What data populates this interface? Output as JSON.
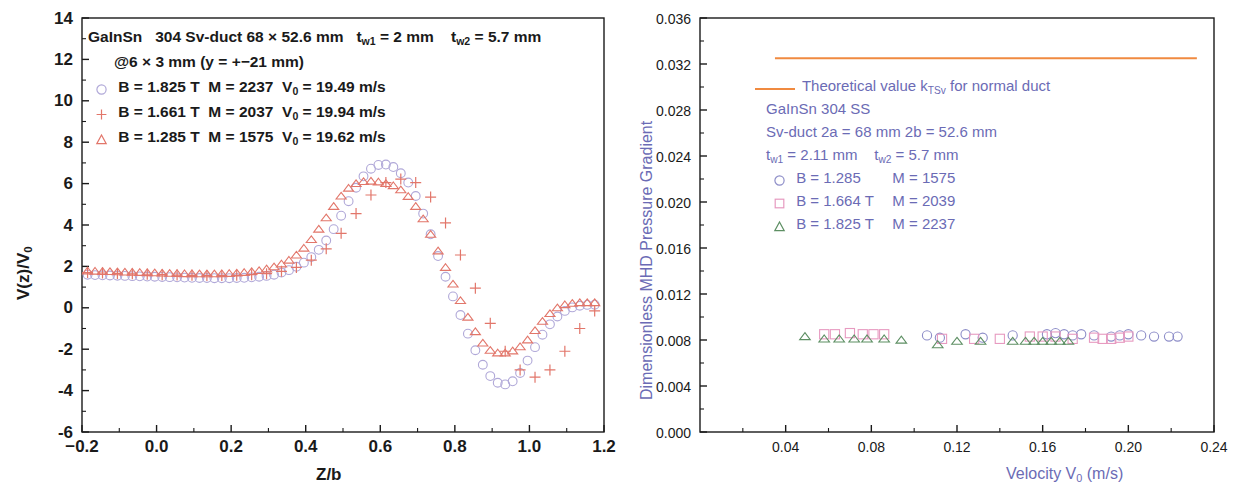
{
  "chart_data": [
    {
      "panel": "left",
      "type": "scatter",
      "title": "",
      "xlabel": "Z/b",
      "ylabel": "V(z)/V0",
      "ylabel_display": "V(z)/V₀",
      "xlim": [
        -0.2,
        1.2
      ],
      "ylim": [
        -6,
        14
      ],
      "xticks": [
        "−0.2",
        "0.0",
        "0.2",
        "0.4",
        "0.6",
        "0.8",
        "1.0",
        "1.2"
      ],
      "xtick_values": [
        -0.2,
        0.0,
        0.2,
        0.4,
        0.6,
        0.8,
        1.0,
        1.2
      ],
      "yticks": [
        "14",
        "12",
        "10",
        "8",
        "6",
        "4",
        "2",
        "0",
        "-2",
        "-4",
        "-6"
      ],
      "ytick_values": [
        14,
        12,
        10,
        8,
        6,
        4,
        2,
        0,
        -2,
        -4,
        -6
      ],
      "grid": false,
      "minor_ticks": true,
      "annotation_lines": [
        "GaInSn   304 Sv-duct 68 × 52.6 mm   t_w1 = 2 mm    t_w2 = 5.7 mm",
        "@6 × 3 mm   (y = +−21 mm)"
      ],
      "legend_position": "upper-left-inside",
      "series": [
        {
          "name": "B = 1.825 T M = 2237  V0 = 19.49 m/s",
          "marker": "circle",
          "color": "#b0a8d8",
          "x": [
            -0.185,
            -0.165,
            -0.145,
            -0.125,
            -0.105,
            -0.085,
            -0.065,
            -0.045,
            -0.025,
            -0.005,
            0.015,
            0.035,
            0.055,
            0.075,
            0.095,
            0.115,
            0.135,
            0.155,
            0.175,
            0.195,
            0.215,
            0.235,
            0.255,
            0.275,
            0.295,
            0.315,
            0.335,
            0.355,
            0.375,
            0.395,
            0.415,
            0.435,
            0.455,
            0.475,
            0.495,
            0.515,
            0.535,
            0.555,
            0.575,
            0.595,
            0.615,
            0.635,
            0.655,
            0.675,
            0.695,
            0.715,
            0.735,
            0.755,
            0.775,
            0.795,
            0.815,
            0.835,
            0.855,
            0.875,
            0.895,
            0.915,
            0.935,
            0.955,
            0.975,
            0.995,
            1.015,
            1.035,
            1.055,
            1.075,
            1.095,
            1.115,
            1.135,
            1.155,
            1.175
          ],
          "y": [
            1.6,
            1.58,
            1.57,
            1.56,
            1.55,
            1.54,
            1.53,
            1.52,
            1.51,
            1.5,
            1.49,
            1.48,
            1.47,
            1.46,
            1.45,
            1.44,
            1.44,
            1.43,
            1.43,
            1.43,
            1.44,
            1.45,
            1.47,
            1.5,
            1.54,
            1.6,
            1.7,
            1.82,
            1.98,
            2.18,
            2.45,
            2.8,
            3.25,
            3.8,
            4.45,
            5.15,
            5.8,
            6.35,
            6.72,
            6.9,
            6.92,
            6.8,
            6.5,
            6.05,
            5.4,
            4.55,
            3.55,
            2.5,
            1.5,
            0.55,
            -0.35,
            -1.25,
            -2.05,
            -2.75,
            -3.3,
            -3.62,
            -3.7,
            -3.55,
            -3.15,
            -2.55,
            -1.9,
            -1.3,
            -0.8,
            -0.42,
            -0.15,
            0.02,
            0.1,
            0.14,
            0.15
          ]
        },
        {
          "name": "B = 1.661 T M = 2037  V0 = 19.94 m/s",
          "marker": "plus",
          "color": "#e2766a",
          "x": [
            -0.185,
            -0.145,
            -0.105,
            -0.065,
            -0.025,
            0.015,
            0.055,
            0.095,
            0.135,
            0.175,
            0.215,
            0.255,
            0.295,
            0.335,
            0.375,
            0.415,
            0.455,
            0.495,
            0.535,
            0.575,
            0.615,
            0.655,
            0.695,
            0.735,
            0.775,
            0.815,
            0.855,
            0.895,
            0.935,
            0.975,
            1.015,
            1.055,
            1.095,
            1.135,
            1.175
          ],
          "y": [
            1.7,
            1.68,
            1.66,
            1.64,
            1.62,
            1.6,
            1.58,
            1.57,
            1.56,
            1.56,
            1.57,
            1.6,
            1.65,
            1.76,
            1.95,
            2.3,
            2.85,
            3.6,
            4.55,
            5.45,
            6.05,
            6.22,
            6.05,
            5.35,
            4.1,
            2.55,
            0.95,
            -0.75,
            -2.1,
            -3.0,
            -3.35,
            -3.0,
            -2.1,
            -1.0,
            -0.15
          ]
        },
        {
          "name": "B = 1.285 T M = 1575  V0 = 19.62 m/s",
          "marker": "triangle",
          "color": "#e2766a",
          "x": [
            -0.185,
            -0.165,
            -0.145,
            -0.125,
            -0.105,
            -0.085,
            -0.065,
            -0.045,
            -0.025,
            -0.005,
            0.015,
            0.035,
            0.055,
            0.075,
            0.095,
            0.115,
            0.135,
            0.155,
            0.175,
            0.195,
            0.215,
            0.235,
            0.255,
            0.275,
            0.295,
            0.315,
            0.335,
            0.355,
            0.375,
            0.395,
            0.415,
            0.435,
            0.455,
            0.475,
            0.495,
            0.515,
            0.535,
            0.555,
            0.575,
            0.595,
            0.615,
            0.635,
            0.655,
            0.675,
            0.695,
            0.715,
            0.735,
            0.755,
            0.775,
            0.795,
            0.815,
            0.835,
            0.855,
            0.875,
            0.895,
            0.915,
            0.935,
            0.955,
            0.975,
            0.995,
            1.015,
            1.035,
            1.055,
            1.075,
            1.095,
            1.115,
            1.135,
            1.155,
            1.175
          ],
          "y": [
            1.78,
            1.77,
            1.76,
            1.75,
            1.74,
            1.73,
            1.72,
            1.71,
            1.7,
            1.69,
            1.68,
            1.67,
            1.66,
            1.65,
            1.65,
            1.64,
            1.64,
            1.64,
            1.65,
            1.66,
            1.68,
            1.71,
            1.75,
            1.8,
            1.88,
            1.98,
            2.12,
            2.3,
            2.55,
            2.88,
            3.3,
            3.8,
            4.35,
            4.9,
            5.4,
            5.78,
            6.0,
            6.1,
            6.12,
            6.08,
            6.0,
            5.9,
            5.7,
            5.38,
            4.9,
            4.3,
            3.55,
            2.75,
            1.95,
            1.15,
            0.35,
            -0.45,
            -1.15,
            -1.7,
            -2.05,
            -2.18,
            -2.18,
            -2.08,
            -1.88,
            -1.55,
            -1.1,
            -0.65,
            -0.28,
            0.0,
            0.15,
            0.22,
            0.25,
            0.25,
            0.25
          ]
        }
      ]
    },
    {
      "panel": "right",
      "type": "scatter",
      "title": "",
      "xlabel": "Velocity V0 (m/s)",
      "xlabel_display": "Velocity V₀  (m/s)",
      "ylabel": "Dimensionless MHD Pressure Gradient",
      "xlim": [
        0.0,
        0.24
      ],
      "ylim": [
        0.0,
        0.036
      ],
      "xticks": [
        "0.04",
        "0.08",
        "0.12",
        "0.16",
        "0.20",
        "0.24"
      ],
      "xtick_values": [
        0.04,
        0.08,
        0.12,
        0.16,
        0.2,
        0.24
      ],
      "yticks": [
        "0.036",
        "0.032",
        "0.028",
        "0.024",
        "0.020",
        "0.016",
        "0.012",
        "0.008",
        "0.004",
        "0.000"
      ],
      "ytick_values": [
        0.036,
        0.032,
        0.028,
        0.024,
        0.02,
        0.016,
        0.012,
        0.008,
        0.004,
        0.0
      ],
      "grid": false,
      "minor_ticks": true,
      "legend_position": "upper-middle-inside",
      "annotation_lines": [
        "GaInSn  304 SS",
        "Sv-duct   2a = 68 mm   2b = 52.6 mm",
        "t_w1 = 2.11 mm    t_w2 = 5.7 mm"
      ],
      "reference_line": {
        "name": "Theoretical value k_TSv for normal duct",
        "color": "#f08a40",
        "value": 0.0325,
        "x_start": 0.035,
        "x_end": 0.232
      },
      "series": [
        {
          "name": "B = 1.285    M = 1575",
          "marker": "circle",
          "color": "#8d8dc8",
          "x": [
            0.106,
            0.112,
            0.124,
            0.132,
            0.146,
            0.162,
            0.166,
            0.17,
            0.174,
            0.178,
            0.184,
            0.192,
            0.196,
            0.2,
            0.206,
            0.212,
            0.219,
            0.223
          ],
          "y": [
            0.0084,
            0.0082,
            0.0085,
            0.0082,
            0.0084,
            0.0085,
            0.0086,
            0.0085,
            0.0084,
            0.0085,
            0.0084,
            0.0083,
            0.0084,
            0.0085,
            0.0084,
            0.0083,
            0.0083,
            0.0083
          ]
        },
        {
          "name": "B = 1.664 T  M = 2039",
          "marker": "square",
          "color": "#e79ac0",
          "x": [
            0.058,
            0.063,
            0.07,
            0.076,
            0.081,
            0.086,
            0.113,
            0.128,
            0.14,
            0.154,
            0.16,
            0.166,
            0.174,
            0.184,
            0.188,
            0.192,
            0.196,
            0.2
          ],
          "y": [
            0.0085,
            0.0085,
            0.0086,
            0.0085,
            0.0085,
            0.0085,
            0.0081,
            0.0081,
            0.0081,
            0.0083,
            0.0083,
            0.0083,
            0.0081,
            0.0082,
            0.0081,
            0.0081,
            0.0082,
            0.0083
          ]
        },
        {
          "name": "B = 1.825 T  M = 2237",
          "marker": "triangle",
          "color": "#5d8f63",
          "x": [
            0.049,
            0.058,
            0.065,
            0.072,
            0.078,
            0.086,
            0.094,
            0.111,
            0.12,
            0.131,
            0.146,
            0.152,
            0.156,
            0.16,
            0.164,
            0.168,
            0.172
          ],
          "y": [
            0.0083,
            0.0081,
            0.0081,
            0.0081,
            0.0081,
            0.0081,
            0.008,
            0.0076,
            0.0079,
            0.0079,
            0.0079,
            0.0079,
            0.0079,
            0.0079,
            0.0079,
            0.0079,
            0.0079
          ]
        }
      ]
    }
  ],
  "left_panel": {
    "annotation": {
      "line1_a": "GaInSn",
      "line1_b": "304 Sv-duct 68 × 52.6 mm",
      "line1_c_pre": "t",
      "line1_c_sub": "w1",
      "line1_c_post": " = 2 mm",
      "line1_d_pre": "t",
      "line1_d_sub": "w2",
      "line1_d_post": " = 5.7 mm",
      "line2": "@6 × 3 mm   (y = +−21 mm)"
    },
    "legend": [
      {
        "marker": "circle",
        "color": "#b0a8d8",
        "b": "B = 1.825 T",
        "m": "M = 2237",
        "v_pre": "V",
        "v_sub": "0",
        "v_post": " = 19.49 m/s"
      },
      {
        "marker": "plus",
        "color": "#e2766a",
        "b": "B = 1.661 T",
        "m": "M = 2037",
        "v_pre": "V",
        "v_sub": "0",
        "v_post": " = 19.94 m/s"
      },
      {
        "marker": "triangle",
        "color": "#e2766a",
        "b": "B = 1.285 T",
        "m": "M = 1575",
        "v_pre": "V",
        "v_sub": "0",
        "v_post": " = 19.62 m/s"
      }
    ],
    "x_title": "Z/b",
    "y_title_pre": "V(z)/V",
    "y_title_sub": "0"
  },
  "right_panel": {
    "reference_legend": {
      "text_pre": "Theoretical value k",
      "text_sub": "TSv",
      "text_post": " for normal duct",
      "color": "#f08a40"
    },
    "annotation": [
      {
        "text": "GaInSn  304 SS"
      },
      {
        "text": "Sv-duct   2a = 68 mm   2b = 52.6 mm"
      }
    ],
    "annotation_thickness": {
      "t1_pre": "t",
      "t1_sub": "w1",
      "t1_post": " = 2.11 mm",
      "t2_pre": "t",
      "t2_sub": "w2",
      "t2_post": " = 5.7 mm"
    },
    "legend": [
      {
        "marker": "circle",
        "color": "#8d8dc8",
        "b": "B = 1.285",
        "m": "M = 1575"
      },
      {
        "marker": "square",
        "color": "#e79ac0",
        "b": "B = 1.664 T",
        "m": "M = 2039"
      },
      {
        "marker": "triangle",
        "color": "#5d8f63",
        "b": "B = 1.825 T",
        "m": "M = 2237"
      }
    ],
    "x_title_pre": "Velocity V",
    "x_title_sub": "0",
    "x_title_post": "  (m/s)",
    "y_title": "Dimensionless MHD Pressure Gradient"
  },
  "colors": {
    "axis": "#1a1a1a",
    "left_circle": "#b0a8d8",
    "left_plus": "#e2766a",
    "left_triangle": "#e2766a",
    "right_circle": "#8d8dc8",
    "right_square": "#e79ac0",
    "right_triangle": "#5d8f63",
    "reference_line": "#f08a40",
    "right_label_text": "#6b6bb5"
  }
}
